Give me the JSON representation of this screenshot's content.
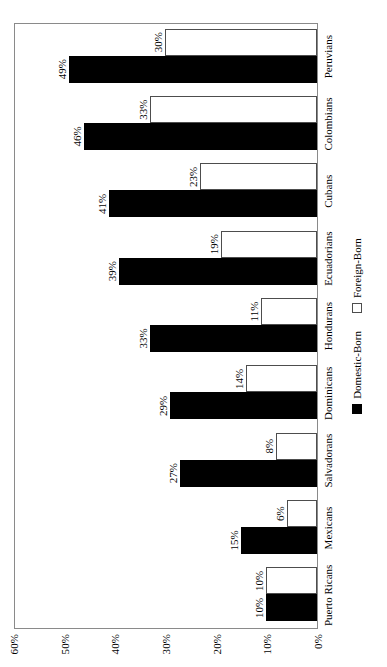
{
  "chart_data": {
    "type": "bar",
    "title": "",
    "subtitle": "",
    "xlabel": "",
    "ylabel": "",
    "orientation": "vertical-bars-rotated-90",
    "grid": false,
    "legend_position": "bottom-center",
    "ylim": [
      0,
      60
    ],
    "ytick_labels": [
      "0%",
      "10%",
      "20%",
      "30%",
      "40%",
      "50%",
      "60%"
    ],
    "ytick_values": [
      0,
      10,
      20,
      30,
      40,
      50,
      60
    ],
    "categories": [
      "Puerto Ricans",
      "Mexicans",
      "Salvadorans",
      "Dominicans",
      "Hondurans",
      "Ecuadorians",
      "Cubans",
      "Colombians",
      "Peruvians"
    ],
    "series": [
      {
        "name": "Domestic-Born",
        "color": "#000000",
        "values": [
          10,
          15,
          27,
          29,
          33,
          39,
          41,
          46,
          49
        ],
        "labels": [
          "10%",
          "15%",
          "27%",
          "29%",
          "33%",
          "39%",
          "41%",
          "46%",
          "49%"
        ]
      },
      {
        "name": "Foreign-Born",
        "color": "#ffffff",
        "values": [
          10,
          6,
          8,
          14,
          11,
          19,
          23,
          33,
          30
        ],
        "labels": [
          "10%",
          "6%",
          "8%",
          "14%",
          "11%",
          "19%",
          "23%",
          "33%",
          "30%"
        ]
      }
    ]
  },
  "legend": {
    "items": [
      {
        "label": "Domestic-Born",
        "swatch": "filled-black-square"
      },
      {
        "label": "Foreign-Born",
        "swatch": "outline-white-square"
      }
    ]
  },
  "colors": {
    "domestic_born": "#000000",
    "foreign_born": "#ffffff",
    "axis_line": "#8a8a8a",
    "bar_outline": "#4d4d4d",
    "background": "#ffffff"
  }
}
